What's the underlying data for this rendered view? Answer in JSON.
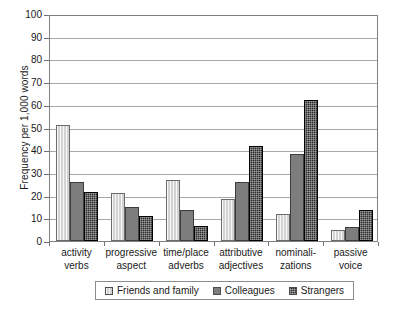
{
  "chart_data": {
    "type": "bar",
    "title": "",
    "xlabel": "",
    "ylabel": "Frequency per 1,000 words",
    "ylim": [
      0,
      100
    ],
    "ytick_step": 10,
    "yticks": [
      100,
      90,
      80,
      70,
      60,
      50,
      40,
      30,
      20,
      10,
      0
    ],
    "grid": true,
    "legend_position": "bottom",
    "categories": [
      "activity verbs",
      "progressive aspect",
      "time/place adverbs",
      "attributive adjectives",
      "nominali- zations",
      "passive voice"
    ],
    "category_lines": [
      [
        "activity",
        "verbs"
      ],
      [
        "progressive",
        "aspect"
      ],
      [
        "time/place",
        "adverbs"
      ],
      [
        "attributive",
        "adjectives"
      ],
      [
        "nominali-",
        "zations"
      ],
      [
        "passive",
        "voice"
      ]
    ],
    "series": [
      {
        "name": "Friends and family",
        "color": "#d2d2d2",
        "pattern": "light-vertical-hatch",
        "values": [
          51,
          21,
          27,
          18.5,
          12,
          5
        ]
      },
      {
        "name": "Colleagues",
        "color": "#7d7d7d",
        "pattern": "solid-gray",
        "values": [
          26,
          15,
          13.5,
          26,
          38.5,
          6
        ]
      },
      {
        "name": "Strangers",
        "color": "#2b2b2b",
        "pattern": "dark-checker",
        "values": [
          21.5,
          11,
          6.5,
          42,
          62,
          13.5
        ]
      }
    ]
  },
  "legend": {
    "items": [
      {
        "label": "Friends and family"
      },
      {
        "label": "Colleagues"
      },
      {
        "label": "Strangers"
      }
    ]
  }
}
